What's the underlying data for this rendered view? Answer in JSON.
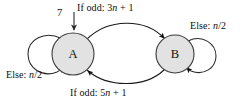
{
  "diagram": {
    "type": "state-machine",
    "nodes": [
      {
        "id": "A",
        "label": "A",
        "cx": 73,
        "cy": 54,
        "r": 21,
        "fill": "#e2e2e2",
        "stroke": "#3a3a3a"
      },
      {
        "id": "B",
        "label": "B",
        "cx": 175,
        "cy": 54,
        "r": 19,
        "fill": "#e2e2e2",
        "stroke": "#3a3a3a"
      }
    ],
    "input": {
      "value": "7",
      "target": "A",
      "arrow": "down-arrow-icon"
    },
    "edges": [
      {
        "id": "a-to-b",
        "from": "A",
        "to": "B",
        "label_prefix": "If odd: 3",
        "label_italic": "n",
        "label_suffix": " + 1",
        "label_full": "If odd: 3n + 1",
        "position": "top"
      },
      {
        "id": "b-to-a",
        "from": "B",
        "to": "A",
        "label_prefix": "If odd: 5",
        "label_italic": "n",
        "label_suffix": " + 1",
        "label_full": "If odd: 5n + 1",
        "position": "bottom"
      },
      {
        "id": "a-self-loop",
        "from": "A",
        "to": "A",
        "label_prefix": "Else: ",
        "label_italic": "n",
        "label_suffix": "/2",
        "label_full": "Else: n/2",
        "position": "left"
      },
      {
        "id": "b-self-loop",
        "from": "B",
        "to": "B",
        "label_prefix": "Else: ",
        "label_italic": "n",
        "label_suffix": "/2",
        "label_full": "Else: n/2",
        "position": "right"
      }
    ],
    "colors": {
      "node_fill": "#e2e2e2",
      "node_stroke": "#3a3a3a",
      "edge_stroke": "#1a1a1a",
      "text": "#0d0d0d",
      "background": "#ffffff",
      "entry_arrow": "#6e6e6e"
    }
  }
}
